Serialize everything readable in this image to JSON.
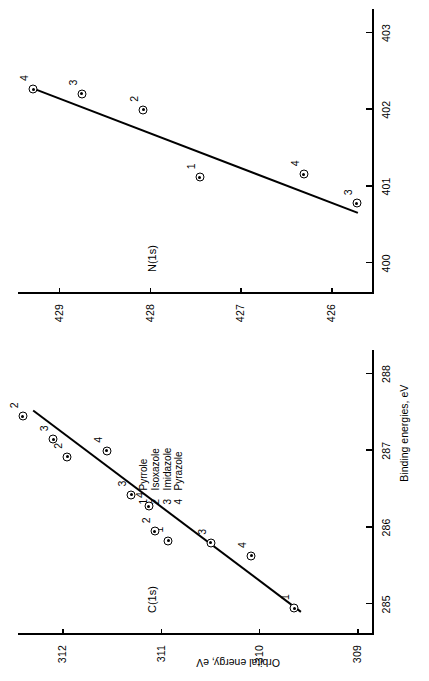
{
  "figure": {
    "axis_titles": {
      "x": "Binding energies, eV",
      "y": "Orbital energy, eV"
    },
    "legend": {
      "entries": [
        {
          "key": "1",
          "label": "Pyrrole"
        },
        {
          "key": "2",
          "label": "Isoxazole"
        },
        {
          "key": "3",
          "label": "Imidazole"
        },
        {
          "key": "4",
          "label": "Pyrazole"
        }
      ]
    },
    "panels": [
      {
        "id": "c1s",
        "title": "C(1s)"
      },
      {
        "id": "n1s",
        "title": "N(1s)"
      }
    ],
    "ticks": {
      "c_x": [
        "285",
        "286",
        "287",
        "288"
      ],
      "c_y": [
        "309",
        "310",
        "311",
        "312"
      ],
      "n_x": [
        "400",
        "401",
        "402",
        "403"
      ],
      "n_y": [
        "426",
        "427",
        "428",
        "429"
      ]
    },
    "line_color": "#000000",
    "marker_color": "#000000"
  },
  "chart_data": [
    {
      "type": "scatter",
      "id": "c1s",
      "title": "C(1s)",
      "xlabel": "Binding energies, eV",
      "ylabel": "Orbital energy, eV",
      "xlim": [
        284.6,
        288.3
      ],
      "ylim": [
        308.85,
        312.45
      ],
      "xticks": [
        285,
        286,
        287,
        288
      ],
      "yticks": [
        309,
        310,
        311,
        312
      ],
      "grid": false,
      "legend_position": "center",
      "points": [
        {
          "label": "1",
          "compound": "Pyrrole",
          "x": 284.95,
          "y": 309.64
        },
        {
          "label": "3",
          "compound": "Imidazole",
          "x": 285.8,
          "y": 310.49
        },
        {
          "label": "4",
          "compound": "Pyrazole",
          "x": 285.63,
          "y": 310.08
        },
        {
          "label": "1",
          "compound": "Pyrrole",
          "x": 285.83,
          "y": 310.92
        },
        {
          "label": "2",
          "compound": "Isoxazole",
          "x": 285.95,
          "y": 311.06
        },
        {
          "label": "4",
          "compound": "Pyrazole",
          "x": 286.28,
          "y": 311.12
        },
        {
          "label": "3",
          "compound": "Imidazole",
          "x": 286.43,
          "y": 311.3
        },
        {
          "label": "4",
          "compound": "Pyrazole",
          "x": 287.0,
          "y": 311.55
        },
        {
          "label": "2",
          "compound": "Isoxazole",
          "x": 286.92,
          "y": 311.95
        },
        {
          "label": "3",
          "compound": "Imidazole",
          "x": 287.15,
          "y": 312.09
        },
        {
          "label": "2",
          "compound": "Isoxazole",
          "x": 287.45,
          "y": 312.4
        }
      ],
      "fit_line": {
        "x0": 284.9,
        "y0": 309.58,
        "x1": 287.52,
        "y1": 312.3
      }
    },
    {
      "type": "scatter",
      "id": "n1s",
      "title": "N(1s)",
      "xlabel": "Binding energies, eV",
      "ylabel": "Orbital energy, eV",
      "xlim": [
        399.6,
        403.3
      ],
      "ylim": [
        425.55,
        429.45
      ],
      "xticks": [
        400,
        401,
        402,
        403
      ],
      "yticks": [
        426,
        427,
        428,
        429
      ],
      "grid": false,
      "points": [
        {
          "label": "3",
          "compound": "Imidazole",
          "x": 400.78,
          "y": 425.72
        },
        {
          "label": "4",
          "compound": "Pyrazole",
          "x": 401.16,
          "y": 426.3
        },
        {
          "label": "1",
          "compound": "Pyrrole",
          "x": 401.12,
          "y": 427.45
        },
        {
          "label": "2",
          "compound": "Isoxazole",
          "x": 402.0,
          "y": 428.07
        },
        {
          "label": "3",
          "compound": "Imidazole",
          "x": 402.21,
          "y": 428.75
        },
        {
          "label": "4",
          "compound": "Pyrazole",
          "x": 402.27,
          "y": 429.28
        }
      ],
      "fit_line": {
        "x0": 400.66,
        "y0": 425.72,
        "x1": 402.28,
        "y1": 429.3
      }
    }
  ]
}
